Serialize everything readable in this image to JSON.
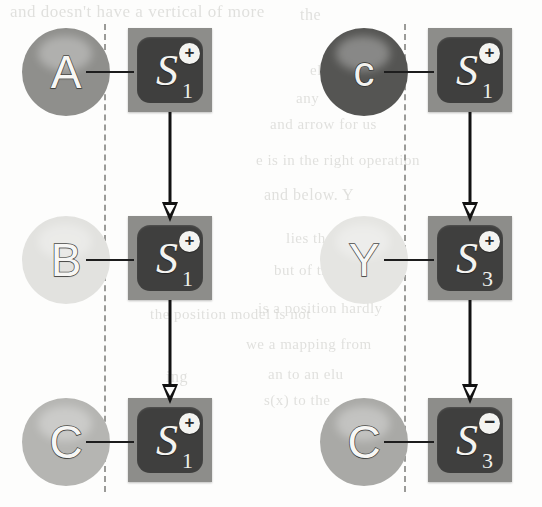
{
  "figure": {
    "background_color": "#fdfdfc",
    "box_outer_color": "#8d8d8a",
    "box_inner_color": "#3f3f3e",
    "line_color": "#1d1d1d",
    "guide_color": "#9b9b98"
  },
  "columns": [
    {
      "name": "left-column",
      "guide": {
        "x": 104,
        "top": 24,
        "bottom": 492
      },
      "nodes": [
        {
          "id": "left-row-1",
          "circle": {
            "label": "A",
            "fill": "#8f8f8c",
            "x": 22,
            "y": 28,
            "size": 88
          },
          "box": {
            "state": "S",
            "superscript": "+",
            "subscript": "1",
            "x": 128,
            "y": 28,
            "size": 84
          },
          "arrow_to_next": true
        },
        {
          "id": "left-row-2",
          "circle": {
            "label": "B",
            "fill": "#e2e2df",
            "x": 22,
            "y": 216,
            "size": 88
          },
          "box": {
            "state": "S",
            "superscript": "+",
            "subscript": "1",
            "x": 128,
            "y": 216,
            "size": 84
          },
          "arrow_to_next": true
        },
        {
          "id": "left-row-3",
          "circle": {
            "label": "C",
            "fill": "#b5b5b2",
            "x": 22,
            "y": 398,
            "size": 88
          },
          "box": {
            "state": "S",
            "superscript": "+",
            "subscript": "1",
            "x": 128,
            "y": 398,
            "size": 84
          },
          "arrow_to_next": false
        }
      ]
    },
    {
      "name": "right-column",
      "guide": {
        "x": 404,
        "top": 24,
        "bottom": 492
      },
      "nodes": [
        {
          "id": "right-row-1",
          "circle": {
            "label": "c",
            "fill": "#555553",
            "x": 320,
            "y": 28,
            "size": 88
          },
          "box": {
            "state": "S",
            "superscript": "+",
            "subscript": "1",
            "x": 428,
            "y": 28,
            "size": 84
          },
          "arrow_to_next": true
        },
        {
          "id": "right-row-2",
          "circle": {
            "label": "Y",
            "fill": "#e5e5e2",
            "x": 320,
            "y": 216,
            "size": 88
          },
          "box": {
            "state": "S",
            "superscript": "+",
            "subscript": "3",
            "x": 428,
            "y": 216,
            "size": 84
          },
          "arrow_to_next": true
        },
        {
          "id": "right-row-3",
          "circle": {
            "label": "C",
            "fill": "#a9a9a6",
            "x": 320,
            "y": 398,
            "size": 88
          },
          "box": {
            "state": "S",
            "superscript": "−",
            "subscript": "3",
            "x": 428,
            "y": 398,
            "size": 84
          },
          "arrow_to_next": false
        }
      ]
    }
  ],
  "bleed_text": [
    {
      "text": "and doesn't have a vertical of more",
      "x": 10,
      "y": 2,
      "size": 17
    },
    {
      "text": "the",
      "x": 300,
      "y": 6,
      "size": 16
    },
    {
      "text": "eli",
      "x": 310,
      "y": 62,
      "size": 15
    },
    {
      "text": "any",
      "x": 296,
      "y": 90,
      "size": 15
    },
    {
      "text": "and arrow for us",
      "x": 270,
      "y": 116,
      "size": 15
    },
    {
      "text": "e is in the right operation",
      "x": 256,
      "y": 152,
      "size": 15
    },
    {
      "text": "and below. Y",
      "x": 264,
      "y": 186,
      "size": 16
    },
    {
      "text": "lies the",
      "x": 286,
      "y": 230,
      "size": 15
    },
    {
      "text": "but of the",
      "x": 274,
      "y": 262,
      "size": 15
    },
    {
      "text": "is a position hardly",
      "x": 258,
      "y": 300,
      "size": 15
    },
    {
      "text": "the position model is not",
      "x": 150,
      "y": 306,
      "size": 15
    },
    {
      "text": "we a mapping from",
      "x": 246,
      "y": 336,
      "size": 15
    },
    {
      "text": "an to an elu",
      "x": 268,
      "y": 366,
      "size": 15
    },
    {
      "text": "ing",
      "x": 166,
      "y": 368,
      "size": 16
    },
    {
      "text": "s(x) to the",
      "x": 264,
      "y": 392,
      "size": 15
    }
  ]
}
